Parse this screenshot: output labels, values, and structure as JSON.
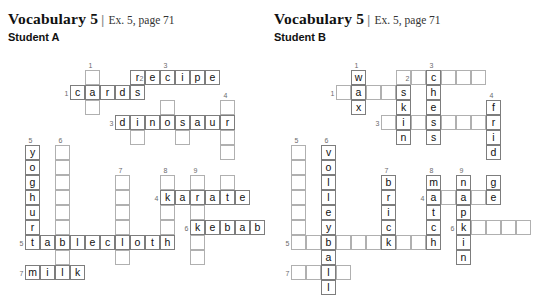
{
  "page": {
    "width": 533,
    "height": 254,
    "cell_size": 15,
    "grid_line_color": "#9a9a9a",
    "text_color": "#111111",
    "clue_number_color": "#6b6b6b"
  },
  "header": {
    "title": "Vocabulary 5",
    "separator": "|",
    "exercise_ref": "Ex. 5, page 71"
  },
  "panels": [
    {
      "id": "student-a",
      "student_label": "Student A",
      "origin": {
        "x": 0,
        "y": 0
      },
      "grid_origin": {
        "x": 25,
        "y": 55
      },
      "answers": {
        "across": [
          {
            "num": 1,
            "word": "cards"
          },
          {
            "num": 2,
            "word": "recipe"
          },
          {
            "num": 3,
            "word": "dinosaur"
          },
          {
            "num": 4,
            "word": "karate"
          },
          {
            "num": 5,
            "word": "tablecloth"
          },
          {
            "num": 6,
            "word": "kebab"
          },
          {
            "num": 7,
            "word": "milk"
          }
        ],
        "down": [
          {
            "num": 1,
            "word": ""
          },
          {
            "num": 3,
            "word": ""
          },
          {
            "num": 4,
            "word": ""
          },
          {
            "num": 5,
            "word": "yoghurt"
          },
          {
            "num": 6,
            "word": ""
          },
          {
            "num": 7,
            "word": ""
          },
          {
            "num": 8,
            "word": ""
          },
          {
            "num": 9,
            "word": ""
          }
        ]
      },
      "clue_numbers": [
        {
          "n": "1",
          "col": 4,
          "row": 0
        },
        {
          "n": "2",
          "col": 7,
          "row": 1,
          "side": true
        },
        {
          "n": "3",
          "col": 9,
          "row": 0
        },
        {
          "n": "1",
          "col": 2,
          "row": 2,
          "side": true
        },
        {
          "n": "4",
          "col": 13,
          "row": 2
        },
        {
          "n": "3",
          "col": 5,
          "row": 4,
          "side": true
        },
        {
          "n": "5",
          "col": 0,
          "row": 5
        },
        {
          "n": "6",
          "col": 2,
          "row": 5
        },
        {
          "n": "7",
          "col": 6,
          "row": 7
        },
        {
          "n": "8",
          "col": 9,
          "row": 7
        },
        {
          "n": "9",
          "col": 11,
          "row": 7
        },
        {
          "n": "4",
          "col": 8,
          "row": 9,
          "side": true
        },
        {
          "n": "6",
          "col": 10,
          "row": 11,
          "side": true
        },
        {
          "n": "5",
          "col": -1,
          "row": 12,
          "side": true
        },
        {
          "n": "7",
          "col": -1,
          "row": 14,
          "side": true
        }
      ],
      "cells": [
        {
          "col": 4,
          "row": 1,
          "ch": ""
        },
        {
          "col": 7,
          "row": 1,
          "ch": "r"
        },
        {
          "col": 8,
          "row": 1,
          "ch": "e"
        },
        {
          "col": 9,
          "row": 1,
          "ch": "c"
        },
        {
          "col": 10,
          "row": 1,
          "ch": "i"
        },
        {
          "col": 11,
          "row": 1,
          "ch": "p"
        },
        {
          "col": 12,
          "row": 1,
          "ch": "e"
        },
        {
          "col": 3,
          "row": 2,
          "ch": "c"
        },
        {
          "col": 4,
          "row": 2,
          "ch": "a"
        },
        {
          "col": 5,
          "row": 2,
          "ch": "r"
        },
        {
          "col": 6,
          "row": 2,
          "ch": "d"
        },
        {
          "col": 7,
          "row": 2,
          "ch": "s"
        },
        {
          "col": 4,
          "row": 3,
          "ch": ""
        },
        {
          "col": 9,
          "row": 3,
          "ch": ""
        },
        {
          "col": 13,
          "row": 3,
          "ch": ""
        },
        {
          "col": 6,
          "row": 4,
          "ch": "d"
        },
        {
          "col": 7,
          "row": 4,
          "ch": "i"
        },
        {
          "col": 8,
          "row": 4,
          "ch": "n"
        },
        {
          "col": 9,
          "row": 4,
          "ch": "o"
        },
        {
          "col": 10,
          "row": 4,
          "ch": "s"
        },
        {
          "col": 11,
          "row": 4,
          "ch": "a"
        },
        {
          "col": 12,
          "row": 4,
          "ch": "u"
        },
        {
          "col": 13,
          "row": 4,
          "ch": "r"
        },
        {
          "col": 7,
          "row": 5,
          "ch": ""
        },
        {
          "col": 10,
          "row": 5,
          "ch": ""
        },
        {
          "col": 13,
          "row": 5,
          "ch": ""
        },
        {
          "col": 0,
          "row": 6,
          "ch": "y"
        },
        {
          "col": 2,
          "row": 6,
          "ch": ""
        },
        {
          "col": 13,
          "row": 6,
          "ch": ""
        },
        {
          "col": 0,
          "row": 7,
          "ch": "o"
        },
        {
          "col": 2,
          "row": 7,
          "ch": ""
        },
        {
          "col": 0,
          "row": 8,
          "ch": "g"
        },
        {
          "col": 2,
          "row": 8,
          "ch": ""
        },
        {
          "col": 6,
          "row": 8,
          "ch": ""
        },
        {
          "col": 9,
          "row": 8,
          "ch": ""
        },
        {
          "col": 11,
          "row": 8,
          "ch": ""
        },
        {
          "col": 13,
          "row": 8,
          "ch": ""
        },
        {
          "col": 0,
          "row": 9,
          "ch": "h"
        },
        {
          "col": 2,
          "row": 9,
          "ch": ""
        },
        {
          "col": 6,
          "row": 9,
          "ch": ""
        },
        {
          "col": 9,
          "row": 9,
          "ch": "k"
        },
        {
          "col": 10,
          "row": 9,
          "ch": "a"
        },
        {
          "col": 11,
          "row": 9,
          "ch": "r"
        },
        {
          "col": 12,
          "row": 9,
          "ch": "a"
        },
        {
          "col": 13,
          "row": 9,
          "ch": "t"
        },
        {
          "col": 14,
          "row": 9,
          "ch": "e"
        },
        {
          "col": 0,
          "row": 10,
          "ch": "u"
        },
        {
          "col": 2,
          "row": 10,
          "ch": ""
        },
        {
          "col": 6,
          "row": 10,
          "ch": ""
        },
        {
          "col": 9,
          "row": 10,
          "ch": ""
        },
        {
          "col": 11,
          "row": 10,
          "ch": ""
        },
        {
          "col": 0,
          "row": 11,
          "ch": "r"
        },
        {
          "col": 2,
          "row": 11,
          "ch": ""
        },
        {
          "col": 6,
          "row": 11,
          "ch": ""
        },
        {
          "col": 9,
          "row": 11,
          "ch": ""
        },
        {
          "col": 11,
          "row": 11,
          "ch": "k"
        },
        {
          "col": 12,
          "row": 11,
          "ch": "e"
        },
        {
          "col": 13,
          "row": 11,
          "ch": "b"
        },
        {
          "col": 14,
          "row": 11,
          "ch": "a"
        },
        {
          "col": 15,
          "row": 11,
          "ch": "b"
        },
        {
          "col": 0,
          "row": 12,
          "ch": "t"
        },
        {
          "col": 1,
          "row": 12,
          "ch": "a"
        },
        {
          "col": 2,
          "row": 12,
          "ch": "b"
        },
        {
          "col": 3,
          "row": 12,
          "ch": "l"
        },
        {
          "col": 4,
          "row": 12,
          "ch": "e"
        },
        {
          "col": 5,
          "row": 12,
          "ch": "c"
        },
        {
          "col": 6,
          "row": 12,
          "ch": "l"
        },
        {
          "col": 7,
          "row": 12,
          "ch": "o"
        },
        {
          "col": 8,
          "row": 12,
          "ch": "t"
        },
        {
          "col": 9,
          "row": 12,
          "ch": "h"
        },
        {
          "col": 11,
          "row": 12,
          "ch": ""
        },
        {
          "col": 2,
          "row": 13,
          "ch": ""
        },
        {
          "col": 6,
          "row": 13,
          "ch": ""
        },
        {
          "col": 11,
          "row": 13,
          "ch": ""
        },
        {
          "col": 0,
          "row": 14,
          "ch": "m"
        },
        {
          "col": 1,
          "row": 14,
          "ch": "i"
        },
        {
          "col": 2,
          "row": 14,
          "ch": "l"
        },
        {
          "col": 3,
          "row": 14,
          "ch": "k"
        }
      ]
    },
    {
      "id": "student-b",
      "student_label": "Student B",
      "origin": {
        "x": 266,
        "y": 0
      },
      "grid_origin": {
        "x": 25,
        "y": 55
      },
      "answers": {
        "across": [
          {
            "num": 1,
            "word": ""
          },
          {
            "num": 2,
            "word": ""
          },
          {
            "num": 3,
            "word": ""
          },
          {
            "num": 4,
            "word": ""
          },
          {
            "num": 5,
            "word": ""
          },
          {
            "num": 6,
            "word": ""
          },
          {
            "num": 7,
            "word": ""
          }
        ],
        "down": [
          {
            "num": 1,
            "word": "wax"
          },
          {
            "num": 2,
            "word": "skin"
          },
          {
            "num": 3,
            "word": "chess"
          },
          {
            "num": 4,
            "word": "fridge"
          },
          {
            "num": 6,
            "word": "volleyball"
          },
          {
            "num": 7,
            "word": "brick"
          },
          {
            "num": 8,
            "word": "match"
          },
          {
            "num": 9,
            "word": "napkin"
          }
        ]
      },
      "clue_numbers": [
        {
          "n": "1",
          "col": 4,
          "row": 0
        },
        {
          "n": "2",
          "col": 7,
          "row": 1,
          "side": true
        },
        {
          "n": "3",
          "col": 9,
          "row": 0
        },
        {
          "n": "1",
          "col": 2,
          "row": 2,
          "side": true
        },
        {
          "n": "4",
          "col": 13,
          "row": 2
        },
        {
          "n": "3",
          "col": 5,
          "row": 4,
          "side": true
        },
        {
          "n": "5",
          "col": 0,
          "row": 5
        },
        {
          "n": "6",
          "col": 2,
          "row": 5
        },
        {
          "n": "7",
          "col": 6,
          "row": 7
        },
        {
          "n": "8",
          "col": 9,
          "row": 7
        },
        {
          "n": "9",
          "col": 11,
          "row": 7
        },
        {
          "n": "4",
          "col": 8,
          "row": 9,
          "side": true
        },
        {
          "n": "6",
          "col": 10,
          "row": 11,
          "side": true
        },
        {
          "n": "5",
          "col": -1,
          "row": 12,
          "side": true
        },
        {
          "n": "7",
          "col": -1,
          "row": 14,
          "side": true
        }
      ],
      "cells": [
        {
          "col": 4,
          "row": 1,
          "ch": "w"
        },
        {
          "col": 7,
          "row": 1,
          "ch": ""
        },
        {
          "col": 8,
          "row": 1,
          "ch": ""
        },
        {
          "col": 9,
          "row": 1,
          "ch": "c"
        },
        {
          "col": 10,
          "row": 1,
          "ch": ""
        },
        {
          "col": 11,
          "row": 1,
          "ch": ""
        },
        {
          "col": 12,
          "row": 1,
          "ch": ""
        },
        {
          "col": 3,
          "row": 2,
          "ch": ""
        },
        {
          "col": 4,
          "row": 2,
          "ch": "a"
        },
        {
          "col": 5,
          "row": 2,
          "ch": ""
        },
        {
          "col": 6,
          "row": 2,
          "ch": ""
        },
        {
          "col": 7,
          "row": 2,
          "ch": "s"
        },
        {
          "col": 9,
          "row": 2,
          "ch": "h"
        },
        {
          "col": 4,
          "row": 3,
          "ch": "x"
        },
        {
          "col": 7,
          "row": 3,
          "ch": "k"
        },
        {
          "col": 9,
          "row": 3,
          "ch": "e"
        },
        {
          "col": 13,
          "row": 3,
          "ch": "f"
        },
        {
          "col": 6,
          "row": 4,
          "ch": ""
        },
        {
          "col": 7,
          "row": 4,
          "ch": "i"
        },
        {
          "col": 8,
          "row": 4,
          "ch": ""
        },
        {
          "col": 9,
          "row": 4,
          "ch": "s"
        },
        {
          "col": 10,
          "row": 4,
          "ch": ""
        },
        {
          "col": 11,
          "row": 4,
          "ch": ""
        },
        {
          "col": 12,
          "row": 4,
          "ch": ""
        },
        {
          "col": 13,
          "row": 4,
          "ch": "r"
        },
        {
          "col": 7,
          "row": 5,
          "ch": "n"
        },
        {
          "col": 9,
          "row": 5,
          "ch": "s"
        },
        {
          "col": 13,
          "row": 5,
          "ch": "i"
        },
        {
          "col": 0,
          "row": 6,
          "ch": ""
        },
        {
          "col": 2,
          "row": 6,
          "ch": "v"
        },
        {
          "col": 13,
          "row": 6,
          "ch": "d"
        },
        {
          "col": 0,
          "row": 7,
          "ch": ""
        },
        {
          "col": 2,
          "row": 7,
          "ch": "o"
        },
        {
          "col": 0,
          "row": 8,
          "ch": ""
        },
        {
          "col": 2,
          "row": 8,
          "ch": "l"
        },
        {
          "col": 6,
          "row": 8,
          "ch": "b"
        },
        {
          "col": 9,
          "row": 8,
          "ch": "m"
        },
        {
          "col": 11,
          "row": 8,
          "ch": "n"
        },
        {
          "col": 13,
          "row": 8,
          "ch": "g"
        },
        {
          "col": 0,
          "row": 9,
          "ch": ""
        },
        {
          "col": 2,
          "row": 9,
          "ch": "l"
        },
        {
          "col": 6,
          "row": 9,
          "ch": "r"
        },
        {
          "col": 9,
          "row": 9,
          "ch": "a"
        },
        {
          "col": 10,
          "row": 9,
          "ch": ""
        },
        {
          "col": 11,
          "row": 9,
          "ch": "a"
        },
        {
          "col": 12,
          "row": 9,
          "ch": ""
        },
        {
          "col": 13,
          "row": 9,
          "ch": "e"
        },
        {
          "col": 0,
          "row": 10,
          "ch": ""
        },
        {
          "col": 2,
          "row": 10,
          "ch": "e"
        },
        {
          "col": 6,
          "row": 10,
          "ch": "i"
        },
        {
          "col": 9,
          "row": 10,
          "ch": "t"
        },
        {
          "col": 11,
          "row": 10,
          "ch": "p"
        },
        {
          "col": 0,
          "row": 11,
          "ch": ""
        },
        {
          "col": 2,
          "row": 11,
          "ch": "y"
        },
        {
          "col": 6,
          "row": 11,
          "ch": "c"
        },
        {
          "col": 9,
          "row": 11,
          "ch": "c"
        },
        {
          "col": 11,
          "row": 11,
          "ch": "k"
        },
        {
          "col": 12,
          "row": 11,
          "ch": ""
        },
        {
          "col": 13,
          "row": 11,
          "ch": ""
        },
        {
          "col": 14,
          "row": 11,
          "ch": ""
        },
        {
          "col": 15,
          "row": 11,
          "ch": ""
        },
        {
          "col": 0,
          "row": 12,
          "ch": ""
        },
        {
          "col": 1,
          "row": 12,
          "ch": ""
        },
        {
          "col": 2,
          "row": 12,
          "ch": "b"
        },
        {
          "col": 3,
          "row": 12,
          "ch": ""
        },
        {
          "col": 4,
          "row": 12,
          "ch": ""
        },
        {
          "col": 5,
          "row": 12,
          "ch": ""
        },
        {
          "col": 6,
          "row": 12,
          "ch": "k"
        },
        {
          "col": 7,
          "row": 12,
          "ch": ""
        },
        {
          "col": 8,
          "row": 12,
          "ch": ""
        },
        {
          "col": 9,
          "row": 12,
          "ch": "h"
        },
        {
          "col": 11,
          "row": 12,
          "ch": "i"
        },
        {
          "col": 2,
          "row": 13,
          "ch": "a"
        },
        {
          "col": 11,
          "row": 13,
          "ch": "n"
        },
        {
          "col": 0,
          "row": 14,
          "ch": ""
        },
        {
          "col": 1,
          "row": 14,
          "ch": ""
        },
        {
          "col": 2,
          "row": 14,
          "ch": "l"
        },
        {
          "col": 3,
          "row": 14,
          "ch": ""
        },
        {
          "col": 2,
          "row": 15,
          "ch": "l"
        }
      ]
    }
  ]
}
